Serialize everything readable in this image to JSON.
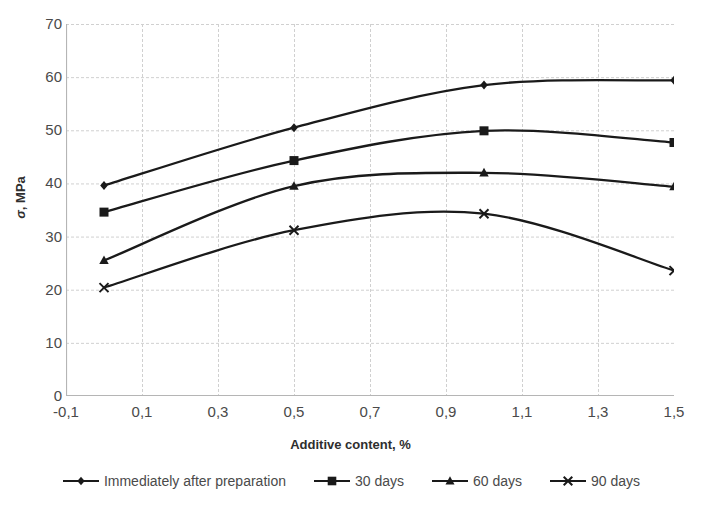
{
  "chart_data": {
    "type": "line",
    "title": "",
    "xlabel": "Additive content, %",
    "ylabel": "σ, MPa",
    "xlim": [
      -0.1,
      1.5
    ],
    "ylim": [
      0,
      70
    ],
    "grid": true,
    "legend_position": "bottom",
    "x": [
      0.0,
      0.5,
      1.0,
      1.5
    ],
    "xticks": [
      -0.1,
      0.1,
      0.3,
      0.5,
      0.7,
      0.9,
      1.1,
      1.3,
      1.5
    ],
    "xtick_labels": [
      "-0,1",
      "0,1",
      "0,3",
      "0,5",
      "0,7",
      "0,9",
      "1,1",
      "1,3",
      "1,5"
    ],
    "yticks": [
      0,
      10,
      20,
      30,
      40,
      50,
      60,
      70
    ],
    "ytick_labels": [
      "0",
      "10",
      "20",
      "30",
      "40",
      "50",
      "60",
      "70"
    ],
    "series": [
      {
        "name": "Immediately after preparation",
        "marker": "diamond",
        "color": "#1a1a1a",
        "values": [
          39.6,
          50.5,
          58.5,
          59.4
        ]
      },
      {
        "name": "30 days",
        "marker": "square",
        "color": "#1a1a1a",
        "values": [
          34.6,
          44.3,
          49.9,
          47.7
        ]
      },
      {
        "name": "60 days",
        "marker": "triangle",
        "color": "#1a1a1a",
        "values": [
          25.5,
          39.5,
          42.0,
          39.4
        ]
      },
      {
        "name": "90 days",
        "marker": "cross",
        "color": "#1a1a1a",
        "values": [
          20.4,
          31.2,
          34.3,
          23.6
        ]
      }
    ]
  },
  "axes": {
    "y_title_symbol": "σ",
    "y_title_unit": ", MPa",
    "x_title": "Additive content, %"
  },
  "legend": {
    "items": [
      {
        "label": "Immediately after preparation",
        "marker": "diamond"
      },
      {
        "label": "30 days",
        "marker": "square"
      },
      {
        "label": "60 days",
        "marker": "triangle"
      },
      {
        "label": "90 days",
        "marker": "cross"
      }
    ]
  },
  "style": {
    "line_color": "#1a1a1a",
    "grid_color": "#d0d0d0",
    "axis_color": "#b5b5b5",
    "text_color": "#4a4a4a"
  }
}
